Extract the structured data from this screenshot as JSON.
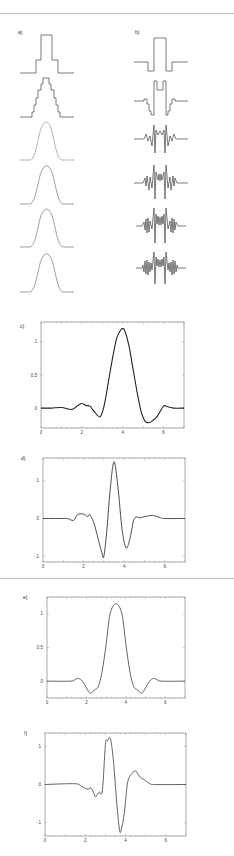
{
  "figure": {
    "panels": [
      {
        "id": "a",
        "label": "a)"
      },
      {
        "id": "b",
        "label": "b)"
      },
      {
        "id": "c",
        "label": "c)"
      },
      {
        "id": "d",
        "label": "d)"
      },
      {
        "id": "e",
        "label": "e)"
      },
      {
        "id": "f",
        "label": "f)"
      }
    ]
  },
  "chart_data": [
    {
      "panel": "a",
      "type": "line",
      "title": "a)",
      "description": "Six stacked curves: box pulse progressively smoothed toward Gaussian (iterated staircase approximation)",
      "series": [
        {
          "name": "row1",
          "shape": "stepped pulse, 2 levels"
        },
        {
          "name": "row2",
          "shape": "stepped pulse, 5 levels"
        },
        {
          "name": "row3",
          "shape": "finely stepped bell"
        },
        {
          "name": "row4",
          "shape": "smooth bell"
        },
        {
          "name": "row5",
          "shape": "smooth bell"
        },
        {
          "name": "row6",
          "shape": "smooth bell"
        }
      ],
      "axes": false
    },
    {
      "panel": "b",
      "type": "line",
      "title": "b)",
      "description": "Six stacked curves: corresponding difference/wavelet-like signals with increasing oscillation detail",
      "series": [
        {
          "name": "row1",
          "shape": "box with negative side lobes"
        },
        {
          "name": "row2",
          "shape": "box with notch and stepped lobes"
        },
        {
          "name": "row3",
          "shape": "spikes with fine oscillations"
        },
        {
          "name": "row4",
          "shape": "spikes with fine oscillations"
        },
        {
          "name": "row5",
          "shape": "spikes with fine oscillations"
        },
        {
          "name": "row6",
          "shape": "spikes with fine oscillations"
        }
      ],
      "axes": false
    },
    {
      "panel": "c",
      "type": "line",
      "title": "c)",
      "xlim": [
        0,
        7
      ],
      "ylim": [
        -0.3,
        1.3
      ],
      "xticks": [
        0,
        2,
        4,
        6
      ],
      "yticks": [
        0,
        0.5,
        1
      ],
      "x": [
        0,
        0.5,
        1,
        1.5,
        1.8,
        2.0,
        2.2,
        2.4,
        2.6,
        2.9,
        3.1,
        3.3,
        3.5,
        3.7,
        3.9,
        4.0,
        4.1,
        4.3,
        4.5,
        4.7,
        4.9,
        5.1,
        5.3,
        5.5,
        5.7,
        6.0,
        6.2,
        6.5,
        7.0
      ],
      "y": [
        0,
        0,
        0.01,
        -0.02,
        0.04,
        0.07,
        0.04,
        0.03,
        -0.05,
        -0.13,
        0.05,
        0.4,
        0.75,
        1.05,
        1.18,
        1.2,
        1.17,
        0.95,
        0.6,
        0.25,
        -0.05,
        -0.2,
        -0.22,
        -0.18,
        -0.12,
        0.03,
        0.02,
        0,
        0
      ]
    },
    {
      "panel": "d",
      "type": "line",
      "title": "d)",
      "xlim": [
        0,
        7
      ],
      "ylim": [
        -1.15,
        1.6
      ],
      "xticks": [
        0,
        2,
        4,
        6
      ],
      "yticks": [
        -1,
        0,
        1
      ],
      "x": [
        0,
        0.8,
        1.2,
        1.5,
        1.7,
        2.0,
        2.2,
        2.3,
        2.5,
        2.7,
        2.9,
        3.0,
        3.15,
        3.3,
        3.5,
        3.7,
        3.9,
        4.1,
        4.3,
        4.5,
        4.8,
        5.0,
        5.4,
        5.8,
        6.0,
        7.0
      ],
      "y": [
        0,
        0,
        0,
        -0.05,
        0.1,
        0.12,
        0.05,
        0.1,
        -0.1,
        -0.5,
        -0.9,
        -1.0,
        -0.3,
        0.7,
        1.5,
        0.8,
        -0.3,
        -0.78,
        -0.5,
        0,
        0.02,
        0.05,
        0.08,
        0.02,
        0,
        0
      ]
    },
    {
      "panel": "e",
      "type": "line",
      "title": "e)",
      "xlim": [
        0,
        7
      ],
      "ylim": [
        -0.25,
        1.25
      ],
      "xticks": [
        0,
        2,
        4,
        6
      ],
      "yticks": [
        0,
        0.5,
        1
      ],
      "x": [
        0,
        1.2,
        1.4,
        1.6,
        1.8,
        2.0,
        2.2,
        2.4,
        2.6,
        2.8,
        3.0,
        3.2,
        3.5,
        3.8,
        4.0,
        4.2,
        4.4,
        4.6,
        4.8,
        5.0,
        5.2,
        5.4,
        5.6,
        5.8,
        7.0
      ],
      "y": [
        0,
        0,
        0.02,
        0.04,
        0.0,
        -0.1,
        -0.18,
        -0.13,
        -0.08,
        0.15,
        0.55,
        1.0,
        1.15,
        1.0,
        0.55,
        0.15,
        -0.08,
        -0.13,
        -0.18,
        -0.1,
        0.0,
        0.04,
        0.02,
        0,
        0
      ]
    },
    {
      "panel": "f",
      "type": "line",
      "title": "f)",
      "xlim": [
        0,
        7
      ],
      "ylim": [
        -1.35,
        1.35
      ],
      "xticks": [
        0,
        2,
        4,
        6
      ],
      "yticks": [
        -1,
        0,
        1
      ],
      "x": [
        0,
        1.5,
        1.8,
        2.1,
        2.3,
        2.5,
        2.6,
        2.7,
        2.85,
        3.0,
        3.1,
        3.25,
        3.4,
        3.55,
        3.7,
        3.8,
        3.95,
        4.1,
        4.3,
        4.5,
        4.7,
        4.85,
        5.0,
        5.2,
        5.5,
        7.0
      ],
      "y": [
        0,
        0.02,
        -0.05,
        -0.12,
        -0.1,
        -0.32,
        -0.25,
        -0.2,
        -0.15,
        1.05,
        1.15,
        1.2,
        0.6,
        -0.4,
        -1.2,
        -1.15,
        -0.7,
        0.05,
        0.28,
        0.35,
        0.2,
        0.15,
        0.1,
        0.02,
        0,
        0
      ]
    }
  ]
}
